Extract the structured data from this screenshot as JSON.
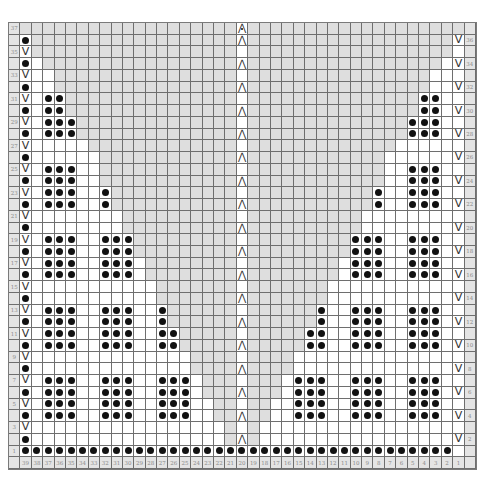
{
  "chart": {
    "type": "knitting-chart",
    "stitch_columns": 39,
    "rows": 37,
    "center_column": 20,
    "colors": {
      "shaded": "#dedede",
      "label_bg": "#e4e4e4",
      "grid_line": "#6e6e6e",
      "dot": "#111111"
    },
    "symbols": {
      "dot": "purl",
      "V": "slip-stitch",
      "⋀": "central-double-decrease",
      "⋀•": "central-double-decrease-variant"
    },
    "left_row_labels": [
      "37",
      "35",
      "33",
      "31",
      "29",
      "27",
      "25",
      "23",
      "21",
      "19",
      "17",
      "15",
      "13",
      "11",
      "9",
      "7",
      "5",
      "3",
      "1"
    ],
    "right_row_labels": [
      "36",
      "34",
      "32",
      "30",
      "28",
      "26",
      "24",
      "22",
      "20",
      "18",
      "16",
      "14",
      "12",
      "10",
      "8",
      "6",
      "4",
      "2"
    ],
    "column_labels": [
      "39",
      "38",
      "37",
      "36",
      "35",
      "34",
      "33",
      "32",
      "31",
      "30",
      "29",
      "28",
      "27",
      "26",
      "25",
      "24",
      "23",
      "22",
      "21",
      "20",
      "19",
      "18",
      "17",
      "16",
      "15",
      "14",
      "13",
      "12",
      "11",
      "10",
      "9",
      "8",
      "7",
      "6",
      "5",
      "4",
      "3",
      "2",
      "1"
    ],
    "shade_start_by_row": {
      "37": 39,
      "36": 38,
      "35": 38,
      "34": 37,
      "33": 36,
      "32": 36,
      "31": 35,
      "30": 35,
      "29": 34,
      "28": 34,
      "27": 33,
      "26": 32,
      "25": 32,
      "24": 32,
      "23": 31,
      "22": 31,
      "21": 30,
      "20": 30,
      "19": 29,
      "18": 29,
      "17": 28,
      "16": 28,
      "15": 27,
      "14": 27,
      "13": 26,
      "12": 26,
      "11": 25,
      "10": 25,
      "9": 24,
      "8": 24,
      "7": 23,
      "6": 23,
      "5": 22,
      "4": 22,
      "3": 21,
      "2": 21,
      "1": 0
    },
    "left_dots_by_row": {
      "31": [
        37,
        36
      ],
      "30": [
        37,
        36
      ],
      "29": [
        37,
        36,
        35
      ],
      "28": [
        37,
        36,
        35
      ],
      "25": [
        37,
        36,
        35
      ],
      "24": [
        37,
        36,
        35
      ],
      "23": [
        37,
        36,
        35,
        32
      ],
      "22": [
        37,
        36,
        35,
        32
      ],
      "19": [
        37,
        36,
        35,
        32,
        31,
        30
      ],
      "18": [
        37,
        36,
        35,
        32,
        31,
        30
      ],
      "17": [
        37,
        36,
        35,
        32,
        31,
        30
      ],
      "16": [
        37,
        36,
        35,
        32,
        31,
        30
      ],
      "13": [
        37,
        36,
        35,
        32,
        31,
        30,
        27
      ],
      "12": [
        37,
        36,
        35,
        32,
        31,
        30,
        27
      ],
      "11": [
        37,
        36,
        35,
        32,
        31,
        30,
        27,
        26
      ],
      "10": [
        37,
        36,
        35,
        32,
        31,
        30,
        27,
        26
      ],
      "7": [
        37,
        36,
        35,
        32,
        31,
        30,
        27,
        26,
        25
      ],
      "6": [
        37,
        36,
        35,
        32,
        31,
        30,
        27,
        26,
        25
      ],
      "5": [
        37,
        36,
        35,
        32,
        31,
        30,
        27,
        26,
        25
      ],
      "4": [
        37,
        36,
        35,
        32,
        31,
        30,
        27,
        26,
        25
      ]
    },
    "edge_rules": {
      "col39_even_rows": "dot",
      "col39_odd_rows_3_to_35": "V",
      "col1_even_rows": "V",
      "row1_all_dots_cols": [
        39,
        2
      ],
      "col20_even_rows": "⋀",
      "col20_row37": "⋀•"
    }
  }
}
